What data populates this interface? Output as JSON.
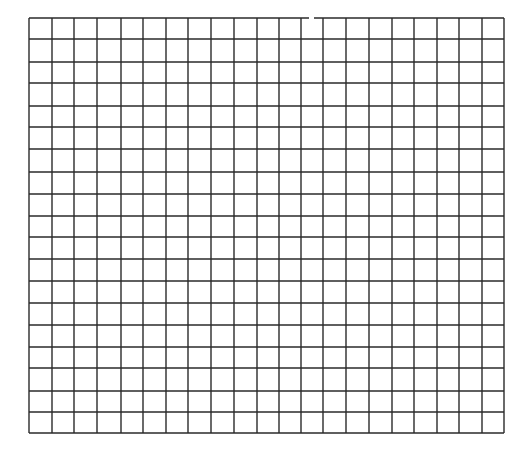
{
  "canvas": {
    "width": 523,
    "height": 449,
    "background": "#ffffff"
  },
  "grid": {
    "columns": 21,
    "rows": 19,
    "line_color": "#2a2a2a",
    "line_width": 1.4,
    "x_lines": [
      29,
      52,
      74,
      97,
      121,
      143,
      166,
      188,
      211,
      234,
      257,
      279,
      301,
      323,
      346,
      369,
      392,
      414,
      437,
      459,
      482,
      504
    ],
    "y_lines": [
      18,
      39,
      62,
      83,
      106,
      127,
      149,
      172,
      194,
      216,
      237,
      259,
      281,
      303,
      325,
      347,
      368,
      391,
      412,
      433
    ],
    "top_border_gap": {
      "x1": 309,
      "x2": 314
    }
  }
}
